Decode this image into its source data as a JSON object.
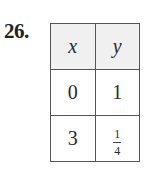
{
  "problem": {
    "number": "26."
  },
  "table": {
    "headers": [
      "x",
      "y"
    ],
    "rows": [
      {
        "x": "0",
        "y": "1"
      },
      {
        "x": "3",
        "y": {
          "numerator": "1",
          "denominator": "4"
        }
      }
    ]
  }
}
